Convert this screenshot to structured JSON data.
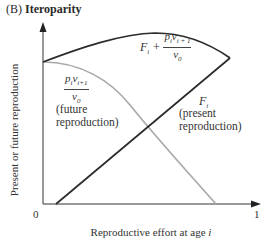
{
  "figure": {
    "panel_letter": "(B)",
    "panel_title": "Iteroparity",
    "y_axis_label": "Present or future reproduction",
    "x_axis_label_prefix": "Reproductive effort at age ",
    "x_axis_label_var": "i",
    "x_tick_0": "0",
    "x_tick_1": "1"
  },
  "curves": {
    "total": {
      "label_F": "F",
      "label_F_sub": "i",
      "label_plus": " + ",
      "frac_num_p": "p",
      "frac_num_p_sub": "i",
      "frac_num_v": "v",
      "frac_num_v_sub": "i + 1",
      "frac_den_v": "v",
      "frac_den_v_sub": "0",
      "color": "#2b2b2b"
    },
    "future": {
      "frac_num_p": "p",
      "frac_num_p_sub": "i",
      "frac_num_v": "v",
      "frac_num_v_sub": "i+1",
      "frac_den_v": "v",
      "frac_den_v_sub": "0",
      "desc_line1": "(future",
      "desc_line2": "reproduction)",
      "color": "#a8a8a8"
    },
    "present": {
      "label_F": "F",
      "label_F_sub": "i",
      "desc_line1": "(present",
      "desc_line2": "reproduction)",
      "color": "#2b2b2b"
    }
  },
  "colors": {
    "axis": "#333333",
    "dark_curve": "#2b2b2b",
    "gray_curve": "#a8a8a8"
  }
}
